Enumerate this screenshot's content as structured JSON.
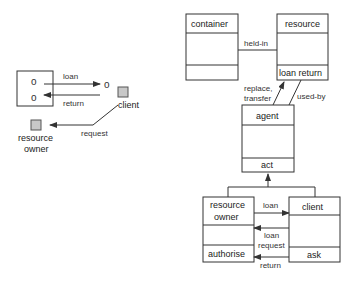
{
  "left_scenario": {
    "container_tokens": [
      "o",
      "o"
    ],
    "loaned_token": "o",
    "arrows": {
      "loan": "loan",
      "return": "return",
      "request": "request"
    },
    "actors": {
      "client": "client",
      "resource_owner_line1": "resource",
      "resource_owner_line2": "owner"
    }
  },
  "class_diagram": {
    "container": {
      "name": "container",
      "operations": ""
    },
    "resource": {
      "name": "resource",
      "operations": "loan return"
    },
    "agent": {
      "name": "agent",
      "operations": "act"
    },
    "resource_owner": {
      "name_line1": "resource",
      "name_line2": "owner",
      "operations": "authorise"
    },
    "client": {
      "name": "client",
      "operations": "ask"
    },
    "associations": {
      "held_in": "held-in",
      "replace_transfer_line1": "replace,",
      "replace_transfer_line2": "transfer",
      "used_by": "used-by",
      "loan": "loan",
      "loan_request_line1": "loan",
      "loan_request_line2": "request",
      "return": "return"
    }
  },
  "colors": {
    "stroke": "#333333",
    "actor_fill": "#c8c8c8",
    "background": "#ffffff"
  }
}
